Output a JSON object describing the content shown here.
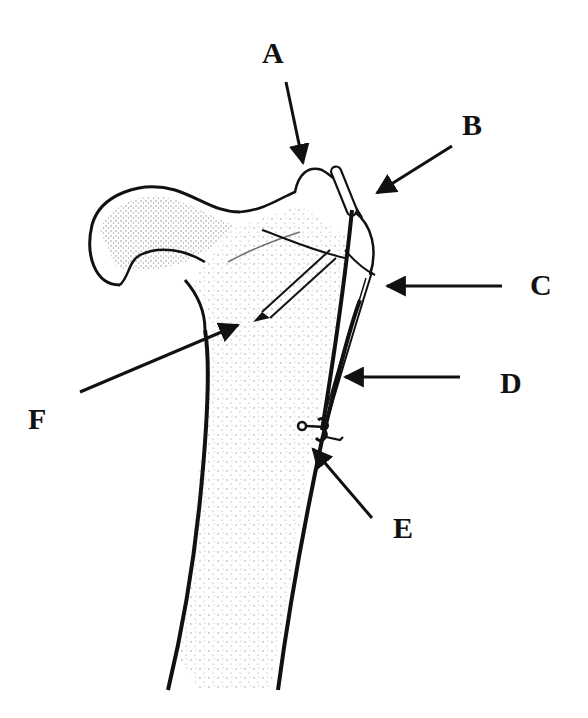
{
  "diagram": {
    "type": "anatomical-illustration",
    "colors": {
      "ink": "#111111",
      "background": "#ffffff",
      "stipple": "#333333"
    },
    "labels": [
      {
        "id": "A",
        "text": "A",
        "x": 262,
        "y": 38,
        "arrow": {
          "x1": 286,
          "y1": 82,
          "x2": 303,
          "y2": 163
        }
      },
      {
        "id": "B",
        "text": "B",
        "x": 462,
        "y": 110,
        "arrow": {
          "x1": 452,
          "y1": 146,
          "x2": 377,
          "y2": 193
        }
      },
      {
        "id": "C",
        "text": "C",
        "x": 530,
        "y": 272,
        "arrow": {
          "x1": 502,
          "y1": 286,
          "x2": 387,
          "y2": 286
        }
      },
      {
        "id": "D",
        "text": "D",
        "x": 500,
        "y": 370,
        "arrow": {
          "x1": 460,
          "y1": 377,
          "x2": 345,
          "y2": 377
        }
      },
      {
        "id": "E",
        "text": "E",
        "x": 393,
        "y": 513,
        "arrow": {
          "x1": 372,
          "y1": 518,
          "x2": 313,
          "y2": 449
        }
      },
      {
        "id": "F",
        "text": "F",
        "x": 28,
        "y": 404,
        "arrow": {
          "x1": 80,
          "y1": 392,
          "x2": 238,
          "y2": 325
        }
      }
    ]
  }
}
